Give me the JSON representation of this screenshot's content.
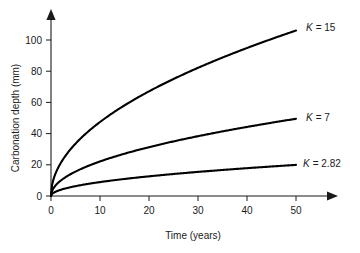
{
  "chart_data": {
    "type": "line",
    "title": "",
    "subtitle": "",
    "xlabel": "Time (years)",
    "ylabel": "Carbonation depth (mm)",
    "xlim": [
      0,
      50
    ],
    "ylim": [
      0,
      110
    ],
    "xticks": [
      0,
      10,
      20,
      30,
      40,
      50
    ],
    "yticks": [
      0,
      20,
      40,
      60,
      80,
      100
    ],
    "xtick_labels": [
      "0",
      "10",
      "20",
      "30",
      "40",
      "50"
    ],
    "ytick_labels": [
      "0",
      "20",
      "40",
      "60",
      "80",
      "100"
    ],
    "grid": false,
    "legend_position": "inline-right-of-curve-ends",
    "relation": "d = K * sqrt(t)",
    "x": [
      0,
      1,
      2,
      3,
      4,
      5,
      6,
      8,
      10,
      12,
      15,
      18,
      20,
      25,
      30,
      35,
      40,
      45,
      50
    ],
    "series": [
      {
        "name": "K = 15",
        "k": 15,
        "label": "K = 15",
        "label_symbol": "K",
        "label_value": "= 15",
        "color": "#000000",
        "values": [
          0,
          15,
          21.2,
          26,
          30,
          33.5,
          36.7,
          42.4,
          47.4,
          52,
          58.1,
          63.6,
          67.1,
          75,
          82.2,
          88.7,
          94.9,
          100.6,
          106.1
        ]
      },
      {
        "name": "K = 7",
        "k": 7,
        "label": "K = 7",
        "label_symbol": "K",
        "label_value": "= 7",
        "color": "#000000",
        "values": [
          0,
          7,
          9.9,
          12.1,
          14,
          15.7,
          17.1,
          19.8,
          22.1,
          24.2,
          27.1,
          29.7,
          31.3,
          35,
          38.3,
          41.4,
          44.3,
          47,
          49.5
        ]
      },
      {
        "name": "K = 2.82",
        "k": 2.82,
        "label": "K = 2.82",
        "label_symbol": "K",
        "label_value": "= 2.82",
        "color": "#000000",
        "values": [
          0,
          2.82,
          3.99,
          4.88,
          5.64,
          6.31,
          6.91,
          7.98,
          8.92,
          9.77,
          10.92,
          11.96,
          12.61,
          14.1,
          15.44,
          16.68,
          17.83,
          18.91,
          19.94
        ]
      }
    ]
  },
  "axes": {
    "x_title": "Time (years)",
    "y_title": "Carbonation depth (mm)"
  }
}
